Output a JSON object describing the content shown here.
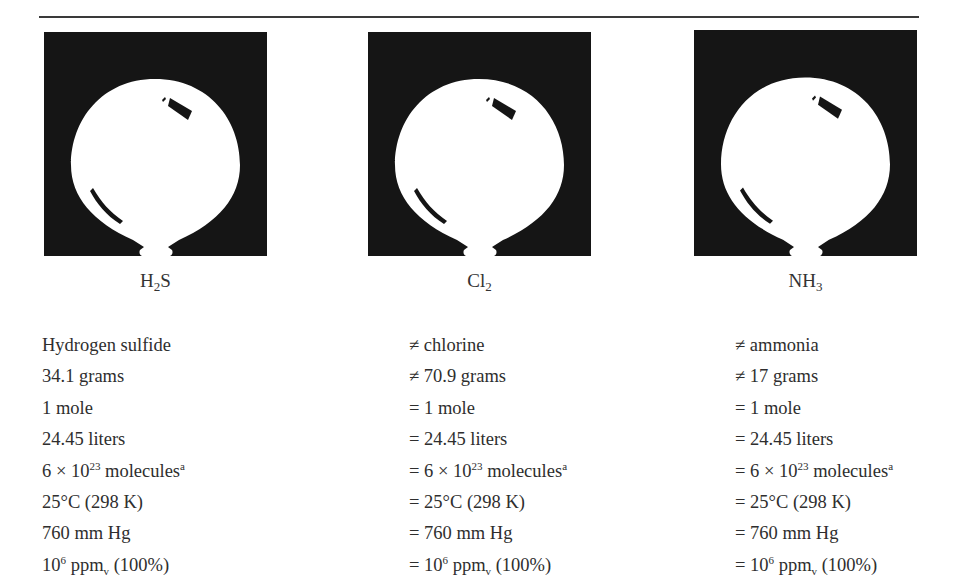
{
  "compounds": [
    {
      "formula": {
        "main": "H",
        "sub": "2",
        "tail": "S"
      },
      "name": "Hydrogen sulfide",
      "mass": "34.1 grams",
      "moles": "1 mole",
      "volume": "24.45 liters",
      "molecules": {
        "prefix": "6 × 10",
        "exp": "23",
        "unit": " molecules",
        "note": "a"
      },
      "temperature": "25°C (298 K)",
      "pressure": "760 mm Hg",
      "concentration": {
        "prefix": "10",
        "exp": "6",
        "unit": " ppm",
        "sub": "v",
        "tail": " (100%)"
      }
    },
    {
      "formula": {
        "main": "Cl",
        "sub": "2",
        "tail": ""
      },
      "name": "≠ chlorine",
      "mass": "≠ 70.9 grams",
      "moles": "= 1 mole",
      "volume": "= 24.45 liters",
      "molecules": {
        "prefix": "= 6 × 10",
        "exp": "23",
        "unit": " molecules",
        "note": "a"
      },
      "temperature": "= 25°C (298 K)",
      "pressure": "= 760 mm Hg",
      "concentration": {
        "prefix": "= 10",
        "exp": "6",
        "unit": " ppm",
        "sub": "v",
        "tail": " (100%)"
      }
    },
    {
      "formula": {
        "main": "NH",
        "sub": "3",
        "tail": ""
      },
      "name": "≠ ammonia",
      "mass": "≠ 17 grams",
      "moles": "= 1 mole",
      "volume": "= 24.45 liters",
      "molecules": {
        "prefix": "= 6 × 10",
        "exp": "23",
        "unit": " molecules",
        "note": "a"
      },
      "temperature": "= 25°C (298 K)",
      "pressure": "= 760 mm Hg",
      "concentration": {
        "prefix": "= 10",
        "exp": "6",
        "unit": " ppm",
        "sub": "v",
        "tail": " (100%)"
      }
    }
  ],
  "icons": [
    "balloon-icon",
    "balloon-icon",
    "balloon-icon"
  ]
}
